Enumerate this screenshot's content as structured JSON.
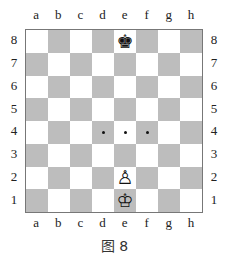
{
  "board": {
    "files": [
      "a",
      "b",
      "c",
      "d",
      "e",
      "f",
      "g",
      "h"
    ],
    "ranks": [
      "8",
      "7",
      "6",
      "5",
      "4",
      "3",
      "2",
      "1"
    ],
    "colors": {
      "light": "#ffffff",
      "dark": "#bdbdbd"
    },
    "pieces": [
      {
        "square": "e8",
        "piece": "black-king",
        "glyph": "♚"
      },
      {
        "square": "e2",
        "piece": "white-pawn",
        "glyph": "♙"
      },
      {
        "square": "e1",
        "piece": "white-king",
        "glyph": "♔"
      }
    ],
    "markers": [
      {
        "square": "d4",
        "type": "dot"
      },
      {
        "square": "e4",
        "type": "dot"
      },
      {
        "square": "f4",
        "type": "dot"
      }
    ]
  },
  "caption": "图 8"
}
